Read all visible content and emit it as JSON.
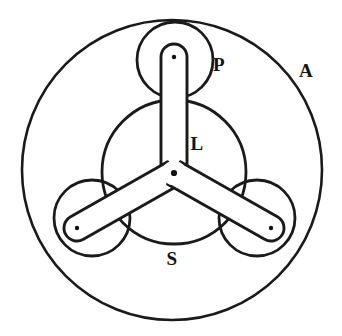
{
  "figure": {
    "background_color": "#ffffff",
    "line_color": "#1a1a1a",
    "width": 342,
    "height": 336
  },
  "labels": {
    "annulus": "A",
    "planet": "P",
    "carrier": "L",
    "sun": "S"
  },
  "label_positions": {
    "annulus": {
      "x": 306,
      "y": 77
    },
    "planet": {
      "x": 219,
      "y": 71
    },
    "carrier": {
      "x": 197,
      "y": 150
    },
    "sun": {
      "x": 172,
      "y": 265
    }
  },
  "geometry": {
    "annulus": {
      "cx": 172,
      "cy": 170,
      "r": 150
    },
    "sun": {
      "cx": 174,
      "cy": 172,
      "r": 72
    },
    "planet_radius": 38,
    "planets": [
      {
        "name": "planet-top",
        "cx": 175,
        "cy": 60
      },
      {
        "name": "planet-left",
        "cx": 92,
        "cy": 218
      },
      {
        "name": "planet-right",
        "cx": 257,
        "cy": 218
      }
    ],
    "carrier": {
      "hub_cx": 174,
      "hub_cy": 173,
      "arm_half_width": 13,
      "tip_radius": 13,
      "arm_tips": [
        {
          "name": "arm-tip-top",
          "cx": 174,
          "cy": 57
        },
        {
          "name": "arm-tip-left",
          "cx": 77,
          "cy": 228
        },
        {
          "name": "arm-tip-right",
          "cx": 271,
          "cy": 228
        }
      ]
    },
    "pivot_dots": [
      {
        "name": "pivot-center",
        "cx": 174,
        "cy": 173,
        "r": 3.1
      },
      {
        "name": "pivot-top",
        "cx": 174,
        "cy": 57,
        "r": 2.2
      },
      {
        "name": "pivot-left",
        "cx": 77,
        "cy": 228,
        "r": 2.2
      },
      {
        "name": "pivot-right",
        "cx": 271,
        "cy": 228,
        "r": 2.2
      }
    ]
  }
}
